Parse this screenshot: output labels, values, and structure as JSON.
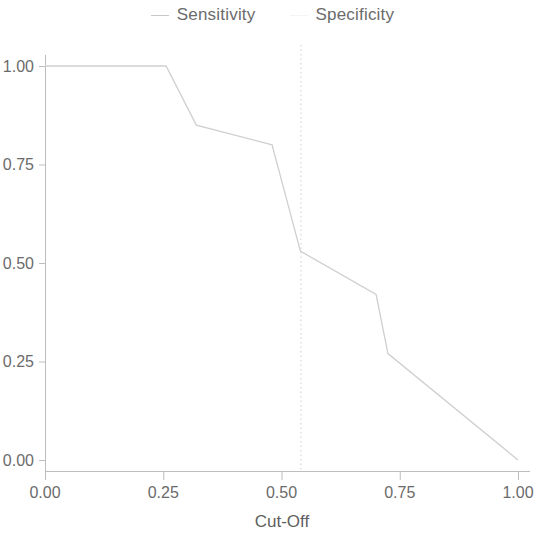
{
  "legend": {
    "entries": [
      {
        "label": "Sensitivity",
        "marker": "line-dash-icon",
        "color": "#c9c9c9",
        "visible_marker": true
      },
      {
        "label": "Specificity",
        "marker": "line-dash-icon",
        "color": "#f4f4f4",
        "visible_marker": false
      }
    ]
  },
  "axes": {
    "x_title": "Cut-Off",
    "y_title": "",
    "x_ticks": [
      "0.00",
      "0.25",
      "0.50",
      "0.75",
      "1.00"
    ],
    "y_ticks": [
      "1.00",
      "0.75",
      "0.50",
      "0.25",
      "0.00"
    ]
  },
  "chart_data": {
    "type": "line",
    "title": "",
    "subtitle": "",
    "xlabel": "Cut-Off",
    "ylabel": "",
    "xlim": [
      0.0,
      1.0
    ],
    "ylim": [
      0.0,
      1.0
    ],
    "xticks": [
      0.0,
      0.25,
      0.5,
      0.75,
      1.0
    ],
    "yticks": [
      0.0,
      0.25,
      0.5,
      0.75,
      1.0
    ],
    "xticklabels": [
      "0.00",
      "0.25",
      "0.50",
      "0.75",
      "1.00"
    ],
    "yticklabels": [
      "0.00",
      "0.25",
      "0.50",
      "0.75",
      "1.00"
    ],
    "grid": false,
    "legend_position": "top-center",
    "series": [
      {
        "name": "Sensitivity",
        "color": "#cfcfcf",
        "linestyle": "solid",
        "x": [
          0.0,
          0.256,
          0.32,
          0.48,
          0.54,
          0.7,
          0.725,
          1.0
        ],
        "values": [
          1.0,
          1.0,
          0.85,
          0.8,
          0.53,
          0.42,
          0.27,
          0.0
        ]
      },
      {
        "name": "Specificity",
        "color": "#fafafa",
        "linestyle": "solid",
        "x": [],
        "values": []
      }
    ],
    "annotations": [
      {
        "type": "vline",
        "name": "cut-off-reference-line",
        "x": 0.54,
        "linestyle": "dotted",
        "color": "#d8d8d8",
        "label": ""
      }
    ]
  }
}
